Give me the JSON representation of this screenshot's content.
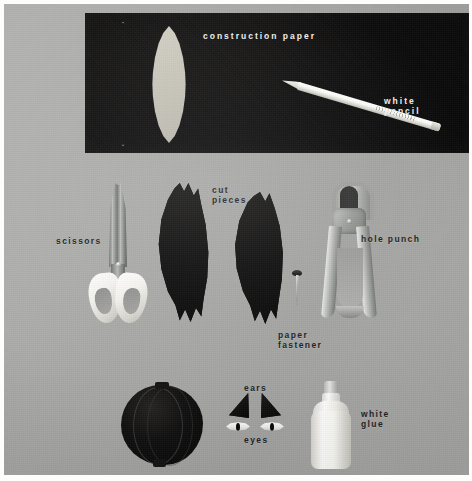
{
  "photo": {
    "kind": "craft-materials-photograph",
    "background_color": "#a9aaa8",
    "paper_color": "#0b0a0a",
    "frame_color": "#fdfdfd"
  },
  "labels": {
    "construction_paper": "construction paper",
    "white_pencil": "white\npencil",
    "scissors": "scissors",
    "cut_pieces": "cut\npieces",
    "hole_punch": "hole punch",
    "paper_fastener": "paper\nfastener",
    "ears": "ears",
    "eyes": "eyes",
    "white_glue": "white\nglue"
  },
  "items": [
    {
      "name": "construction-paper",
      "label": "construction paper",
      "on_black": true
    },
    {
      "name": "white-pencil",
      "label": "white pencil",
      "on_black": true
    },
    {
      "name": "leaf-outline",
      "label": "traced leaf outline",
      "on_black": true
    },
    {
      "name": "leaf-cutout",
      "label": "cut leaf shape",
      "on_black": true
    },
    {
      "name": "scissors",
      "label": "scissors",
      "on_black": false
    },
    {
      "name": "cut-pieces",
      "label": "cut pieces",
      "on_black": false
    },
    {
      "name": "hole-punch",
      "label": "hole punch",
      "on_black": false
    },
    {
      "name": "paper-fastener",
      "label": "paper fastener",
      "on_black": false
    },
    {
      "name": "paper-ball",
      "label": "assembled paper ball",
      "on_black": false
    },
    {
      "name": "ears",
      "label": "ears",
      "on_black": false
    },
    {
      "name": "eyes",
      "label": "eyes",
      "on_black": false
    },
    {
      "name": "white-glue",
      "label": "white glue",
      "on_black": false
    }
  ]
}
